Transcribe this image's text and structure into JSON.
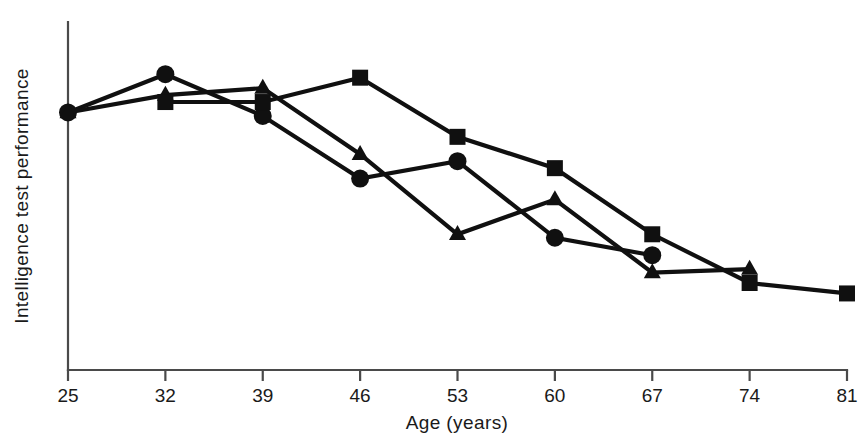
{
  "chart_data": {
    "type": "line",
    "title": "",
    "xlabel": "Age (years)",
    "ylabel": "Intelligence test performance",
    "x": [
      25,
      32,
      39,
      46,
      53,
      60,
      67,
      74,
      81
    ],
    "xticklabels": [
      "25",
      "32",
      "39",
      "46",
      "53",
      "60",
      "67",
      "74",
      "81"
    ],
    "xlim": [
      25,
      81
    ],
    "ylim": [
      0,
      100
    ],
    "y_axis_ticks": [],
    "y_axis_labeled": false,
    "grid": false,
    "legend": "none",
    "marker_color": "#101010",
    "line_color": "#101010",
    "axis_color": "#4a4a4a",
    "background": "#ffffff",
    "series": [
      {
        "name": "circle-series",
        "marker": "circle",
        "x": [
          25,
          32,
          39,
          46,
          53,
          60,
          67
        ],
        "values": [
          74,
          85,
          73,
          55,
          60,
          38,
          33
        ]
      },
      {
        "name": "triangle-series",
        "marker": "triangle",
        "x": [
          25,
          32,
          39,
          46,
          53,
          60,
          67,
          74
        ],
        "values": [
          74,
          79,
          81,
          62,
          39,
          49,
          28,
          29
        ]
      },
      {
        "name": "square-series",
        "marker": "square",
        "x": [
          32,
          39,
          46,
          53,
          60,
          67,
          74,
          81
        ],
        "values": [
          77,
          77,
          84,
          67,
          58,
          39,
          25,
          22
        ]
      }
    ]
  },
  "axis": {
    "x_title": "Age (years)",
    "y_title": "Intelligence test performance",
    "ticks": [
      "25",
      "32",
      "39",
      "46",
      "53",
      "60",
      "67",
      "74",
      "81"
    ]
  }
}
